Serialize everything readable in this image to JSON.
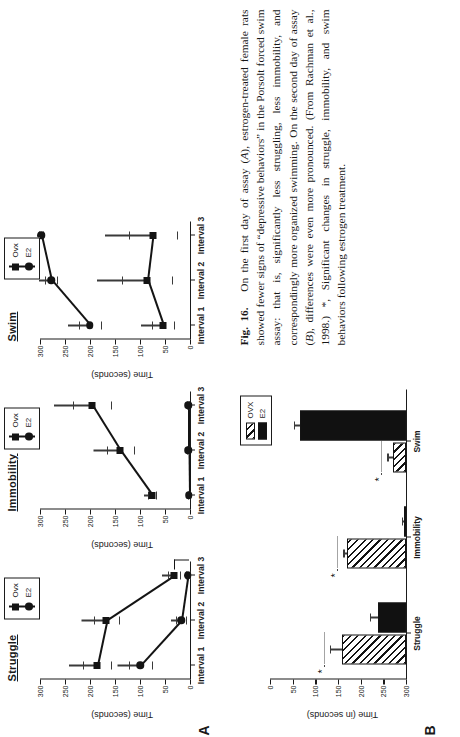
{
  "figure": {
    "label": "Fig. 16.",
    "panel_a_label": "A",
    "panel_b_label": "B",
    "caption_part1": "On the first day of assay (",
    "caption_i1": "A",
    "caption_part2": "), estrogen-treated female rats showed fewer signs of “depressive behaviors” in the Porsolt forced swim assay: that is, significantly less struggling, less immobility, and correspondingly more organized swimming. On the second day of assay (",
    "caption_i2": "B",
    "caption_part3": "), differences were even more pronounced. (From Rachman et al., 1998.) *, Significant changes in struggle, immobility, and swim behaviors following estrogen treatment."
  },
  "panel_a": {
    "y_axis_title": "Time (seconds)",
    "y_ticks": [
      "300",
      "250",
      "200",
      "150",
      "100",
      "50",
      "0"
    ],
    "y_values": [
      300,
      250,
      200,
      150,
      100,
      50,
      0
    ],
    "x_ticks": [
      "Interval 1",
      "Interval 2",
      "Interval 3"
    ],
    "legend": [
      "Ovx",
      "E2"
    ],
    "legend_markers": [
      "square-marker",
      "circle-marker"
    ],
    "significance_marker": "sig-bracket"
  },
  "chart_data": [
    {
      "type": "line",
      "title": "Struggle",
      "panel": "A",
      "xlabel": "",
      "ylabel": "Time (seconds)",
      "ylim": [
        0,
        300
      ],
      "categories": [
        "Interval 1",
        "Interval 2",
        "Interval 3"
      ],
      "series": [
        {
          "name": "Ovx",
          "marker": "square",
          "values": [
            187,
            168,
            32
          ],
          "errors": [
            28,
            25,
            12
          ]
        },
        {
          "name": "E2",
          "marker": "circle",
          "values": [
            100,
            18,
            5
          ],
          "errors": [
            23,
            10,
            4
          ]
        }
      ],
      "annotations": [
        "* significance bracket at Interval 3"
      ]
    },
    {
      "type": "line",
      "title": "Immobility",
      "panel": "A",
      "xlabel": "",
      "ylabel": "Time (seconds)",
      "ylim": [
        0,
        300
      ],
      "categories": [
        "Interval 1",
        "Interval 2",
        "Interval 3"
      ],
      "series": [
        {
          "name": "Ovx",
          "marker": "square",
          "values": [
            76,
            140,
            196
          ],
          "errors": [
            8,
            27,
            38
          ]
        },
        {
          "name": "E2",
          "marker": "circle",
          "values": [
            3,
            4,
            4
          ],
          "errors": [
            2,
            2,
            2
          ]
        }
      ],
      "annotations": []
    },
    {
      "type": "line",
      "title": "Swim",
      "panel": "A",
      "xlabel": "",
      "ylabel": "Time (seconds)",
      "ylim": [
        0,
        300
      ],
      "categories": [
        "Interval 1",
        "Interval 2",
        "Interval 3"
      ],
      "series": [
        {
          "name": "Ovx",
          "marker": "square",
          "values": [
            55,
            86,
            75
          ],
          "errors": [
            22,
            50,
            48
          ]
        },
        {
          "name": "E2",
          "marker": "circle",
          "values": [
            201,
            278,
            298
          ],
          "errors": [
            22,
            12,
            4
          ]
        }
      ],
      "annotations": []
    },
    {
      "type": "bar",
      "title": "",
      "panel": "B",
      "xlabel": "",
      "ylabel": "Time (in seconds)",
      "ylim": [
        0,
        300
      ],
      "y_ticks": [
        "0",
        "50",
        "100",
        "150",
        "200",
        "250",
        "300"
      ],
      "categories": [
        "Struggle",
        "Immobility",
        "Swim"
      ],
      "legend": [
        "OVX",
        "E2"
      ],
      "series": [
        {
          "name": "OVX",
          "fill": "hatched",
          "values": [
            141,
            131,
            28
          ],
          "errors": [
            26,
            7,
            13
          ]
        },
        {
          "name": "E2",
          "fill": "solid",
          "values": [
            62,
            5,
            233
          ],
          "errors": [
            18,
            3,
            14
          ]
        }
      ],
      "annotations": [
        "*",
        "*",
        "*"
      ]
    }
  ],
  "panel_b": {
    "y_axis_title": "Time (in seconds)",
    "y_ticks": [
      "300",
      "250",
      "200",
      "150",
      "100",
      "50",
      "0"
    ],
    "x_ticks": [
      "Struggle",
      "Immobility",
      "Swim"
    ],
    "legend": [
      "OVX",
      "E2"
    ],
    "star": "*"
  }
}
